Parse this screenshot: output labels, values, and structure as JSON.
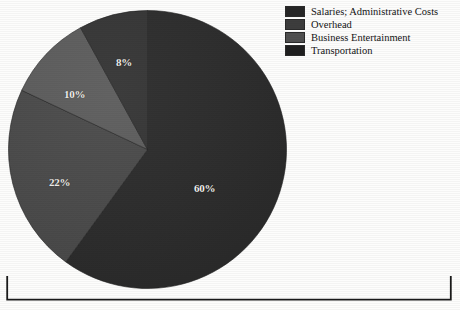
{
  "chart_data": {
    "type": "pie",
    "title": "",
    "labels": [
      "Salaries; Administrative Costs",
      "Overhead",
      "Business Entertainment",
      "Transportation"
    ],
    "values": [
      60,
      22,
      10,
      8
    ],
    "value_labels": [
      "60%",
      "22%",
      "10%",
      "8%"
    ],
    "units": "percent",
    "total": 100,
    "legend_position": "top-right",
    "grid": false,
    "slice_colors": [
      "#2b2b2b",
      "#4a4a4a",
      "#5c5c5c",
      "#343434"
    ],
    "start_angle_deg": 0,
    "direction": "clockwise"
  },
  "pie": {
    "slices": [
      {
        "name": "salaries-administrative-costs",
        "percent_label": "60%",
        "value": 60,
        "color": "#2b2b2b"
      },
      {
        "name": "overhead",
        "percent_label": "22%",
        "value": 22,
        "color": "#4a4a4a"
      },
      {
        "name": "business-entertainment",
        "percent_label": "10%",
        "value": 10,
        "color": "#5c5c5c"
      },
      {
        "name": "transportation",
        "percent_label": "8%",
        "value": 8,
        "color": "#343434"
      }
    ]
  },
  "legend": {
    "items": [
      {
        "label": "Salaries; Administrative Costs",
        "swatch_color": "#262626"
      },
      {
        "label": "Overhead",
        "swatch_color": "#3d3d3d"
      },
      {
        "label": "Business Entertainment",
        "swatch_color": "#505050"
      },
      {
        "label": "Transportation",
        "swatch_color": "#1f1f1f"
      }
    ]
  },
  "footer_rule": {
    "name": "bracket-rule",
    "color": "#1a1a1a"
  }
}
